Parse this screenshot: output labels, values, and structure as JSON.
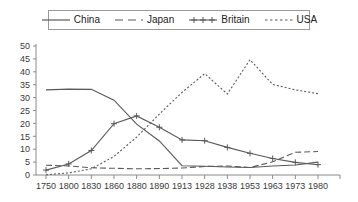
{
  "legend": {
    "position": "top-center",
    "entries": [
      {
        "label": "China",
        "key": "solid-line-key",
        "style": "solid"
      },
      {
        "label": "Japan",
        "key": "dashed-line-key",
        "style": "dashed"
      },
      {
        "label": "Britain",
        "key": "plus-marker-line-key",
        "style": "solid-plus"
      },
      {
        "label": "USA",
        "key": "dotted-line-key",
        "style": "dotted"
      }
    ]
  },
  "axes": {
    "y": {
      "ticks": [
        "0",
        "5",
        "10",
        "15",
        "20",
        "25",
        "30",
        "35",
        "40",
        "45",
        "50"
      ],
      "min": 0,
      "max": 50,
      "step": 5
    },
    "x": {
      "ticks": [
        "1750",
        "1800",
        "1830",
        "1860",
        "1880",
        "1890",
        "1913",
        "1928",
        "1938",
        "1953",
        "1963",
        "1973",
        "1980"
      ]
    }
  },
  "colors": {
    "line": "#595959",
    "axis": "#8a8a8a",
    "text": "#3a3a3a",
    "legend_border": "#9a9a9a",
    "background": "#ffffff"
  },
  "chart_data": {
    "type": "line",
    "title": "",
    "subtitle": "",
    "xlabel": "",
    "ylabel": "",
    "ylim": [
      0,
      50
    ],
    "grid": false,
    "legend_position": "top",
    "categories": [
      "1750",
      "1800",
      "1830",
      "1860",
      "1880",
      "1890",
      "1913",
      "1928",
      "1938",
      "1953",
      "1963",
      "1973",
      "1980"
    ],
    "series": [
      {
        "name": "China",
        "style": "solid",
        "markers": false,
        "values": [
          33,
          33.3,
          33.2,
          29,
          19.7,
          13.2,
          3.6,
          3.4,
          3.1,
          2.9,
          3.5,
          3.9,
          5.0
        ]
      },
      {
        "name": "Japan",
        "style": "dashed",
        "markers": false,
        "values": [
          3.8,
          3.5,
          2.8,
          2.6,
          2.4,
          2.5,
          2.7,
          3.3,
          3.5,
          2.9,
          5.1,
          8.8,
          9.1
        ]
      },
      {
        "name": "Britain",
        "style": "solid-plus",
        "markers": true,
        "values": [
          1.9,
          4.3,
          9.5,
          19.9,
          22.9,
          18.5,
          13.6,
          13.3,
          10.7,
          8.4,
          6.4,
          4.9,
          4.0
        ]
      },
      {
        "name": "USA",
        "style": "dotted",
        "markers": false,
        "values": [
          0.1,
          0.8,
          2.4,
          7.2,
          14.7,
          23.6,
          32.0,
          39.3,
          31.4,
          44.7,
          35.1,
          33.0,
          31.5
        ]
      }
    ]
  }
}
